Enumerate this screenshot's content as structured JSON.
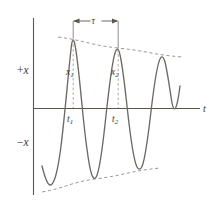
{
  "figure": {
    "name": "damped-oscillation-diagram",
    "axes": {
      "y_positive_label": "+x",
      "y_negative_label": "−x",
      "x_axis_label": "t"
    },
    "annotations": {
      "period_label": "τ",
      "amplitude_1_label": "x",
      "amplitude_1_sub": "1",
      "amplitude_2_label": "x",
      "amplitude_2_sub": "2",
      "time_1_label": "t",
      "time_1_sub": "1",
      "time_2_label": "t",
      "time_2_sub": "2"
    },
    "colors": {
      "curve": "#6e6862",
      "axis": "#5c5650",
      "envelope": "#8d8781",
      "dropline": "#9a948e",
      "text": "#3c3732",
      "background": "#ffffff"
    }
  },
  "chart_data": {
    "type": "line",
    "title": "",
    "subtitle": "",
    "xlabel": "t",
    "ylabel": "x",
    "grid": false,
    "legend": null,
    "xlim": [
      0,
      219
    ],
    "ylim": [
      -1,
      1
    ],
    "axis_origin_px": {
      "x": 33,
      "y": 108
    },
    "y_axis_extent_px": {
      "top": 18,
      "bottom": 195
    },
    "x_axis_extent_px": {
      "left": 33,
      "right": 200
    },
    "period_px": 45,
    "peaks": [
      {
        "label": "x1",
        "t_px": 73,
        "y_px": 39,
        "time_label": "t1"
      },
      {
        "label": "x2",
        "t_px": 118,
        "y_px": 49,
        "time_label": "t2"
      },
      {
        "label": "",
        "t_px": 163,
        "y_px": 57,
        "time_label": ""
      }
    ],
    "troughs": [
      {
        "t_px": 50,
        "y_px": 185
      },
      {
        "t_px": 95,
        "y_px": 176
      },
      {
        "t_px": 140,
        "y_px": 168
      }
    ],
    "upper_envelope_px": [
      {
        "x": 58,
        "y": 37
      },
      {
        "x": 118,
        "y": 48
      },
      {
        "x": 182,
        "y": 57
      }
    ],
    "lower_envelope_px": [
      {
        "x": 42,
        "y": 192
      },
      {
        "x": 95,
        "y": 179
      },
      {
        "x": 160,
        "y": 168
      }
    ],
    "period_arrow_px": {
      "x1": 73,
      "x2": 118,
      "y": 21
    },
    "curve_start_px": {
      "x": 42,
      "y": 166
    },
    "curve_end_px": {
      "x": 180,
      "y": 86
    }
  }
}
